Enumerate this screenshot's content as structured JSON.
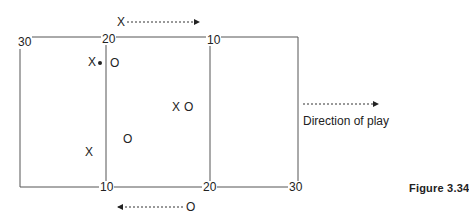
{
  "figure": {
    "caption": "Figure 3.34",
    "direction_label": "Direction of play",
    "top_yard_labels": [
      "30",
      "20",
      "10"
    ],
    "bottom_yard_labels": [
      "10",
      "20",
      "30"
    ],
    "top_arrow_player": "X",
    "bottom_arrow_player": "O",
    "players": [
      {
        "symbol": "X",
        "with_ball": true
      },
      {
        "symbol": "O"
      },
      {
        "symbol": "X"
      },
      {
        "symbol": "O"
      },
      {
        "symbol": "O"
      },
      {
        "symbol": "X"
      }
    ],
    "colors": {
      "line": "#555555",
      "text": "#222222",
      "background": "#ffffff"
    }
  }
}
